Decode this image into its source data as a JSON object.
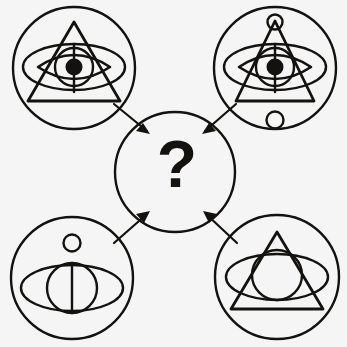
{
  "figure": {
    "type": "matrix-reasoning-puzzle",
    "background_color": "#f5f5f6",
    "ink_color": "#14120f",
    "canvas": {
      "width": 347,
      "height": 347
    }
  },
  "center": {
    "name": "answer-node",
    "label": "?",
    "shape": "circle",
    "cx": 175,
    "cy": 172,
    "r": 60,
    "stroke_width": 2.4
  },
  "arrows": {
    "description": "Four arrows point inward from each corner panel to the center answer circle",
    "count": 4,
    "stroke_width": 2.2,
    "items": [
      {
        "name": "arrow-top-left-to-center",
        "from": "panel-top-left",
        "to": "answer-node",
        "direction": "down-right"
      },
      {
        "name": "arrow-top-right-to-center",
        "from": "panel-top-right",
        "to": "answer-node",
        "direction": "down-left"
      },
      {
        "name": "arrow-bottom-left-to-center",
        "from": "panel-bottom-left",
        "to": "answer-node",
        "direction": "up-right"
      },
      {
        "name": "arrow-bottom-right-to-center",
        "from": "panel-bottom-right",
        "to": "answer-node",
        "direction": "up-left"
      }
    ]
  },
  "panels": [
    {
      "name": "panel-top-left",
      "position": "top-left",
      "cx": 74,
      "cy": 68,
      "r": 61,
      "stroke_width": 2.4,
      "elements": [
        "outer-circle",
        "triangle",
        "ellipse",
        "eye-lens",
        "iris",
        "pupil",
        "vertical-line"
      ],
      "has_triangle": true,
      "has_ellipse": true,
      "has_eye_lens": true,
      "has_iris": true,
      "has_pupil": true,
      "has_vertical_line": true,
      "has_apex_circle": false,
      "has_satellite_circle": false,
      "triangle": {
        "apex_x": 74,
        "apex_y": 22,
        "left_x": 28,
        "right_x": 120,
        "base_y": 101
      },
      "ellipse": {
        "cx": 74,
        "cy": 67,
        "rx": 51,
        "ry": 23
      },
      "eye_lens": {
        "cx": 74,
        "cy": 67,
        "half_width": 36,
        "half_height": 24
      },
      "iris": {
        "cx": 74,
        "cy": 67,
        "r": 19
      },
      "pupil": {
        "cx": 74,
        "cy": 67,
        "r": 8.5
      },
      "vertical_line": {
        "x": 74,
        "y1": 44,
        "y2": 92
      }
    },
    {
      "name": "panel-top-right",
      "position": "top-right",
      "cx": 275,
      "cy": 68,
      "r": 61,
      "stroke_width": 2.4,
      "elements": [
        "outer-circle",
        "apex-circle",
        "triangle",
        "ellipse",
        "eye-lens",
        "iris",
        "pupil",
        "vertical-line",
        "satellite-circle"
      ],
      "has_triangle": true,
      "has_ellipse": true,
      "has_eye_lens": true,
      "has_iris": true,
      "has_pupil": true,
      "has_vertical_line": true,
      "has_apex_circle": true,
      "has_satellite_circle": true,
      "triangle": {
        "apex_x": 275,
        "apex_y": 21,
        "left_x": 236,
        "right_x": 314,
        "base_y": 101
      },
      "apex_circle": {
        "cx": 275,
        "cy": 22,
        "r": 7.5
      },
      "ellipse": {
        "cx": 275,
        "cy": 67,
        "rx": 51,
        "ry": 23
      },
      "eye_lens": {
        "cx": 275,
        "cy": 67,
        "half_width": 36,
        "half_height": 24
      },
      "iris": {
        "cx": 275,
        "cy": 67,
        "r": 19
      },
      "pupil": {
        "cx": 275,
        "cy": 67,
        "r": 8.5
      },
      "vertical_line": {
        "x": 275,
        "y1": 44,
        "y2": 92
      },
      "satellite_circle": {
        "cx": 275,
        "cy": 120,
        "r": 8.5,
        "placement": "below-eye"
      }
    },
    {
      "name": "panel-bottom-left",
      "position": "bottom-left",
      "cx": 72,
      "cy": 278,
      "r": 61,
      "stroke_width": 2.4,
      "elements": [
        "outer-circle",
        "satellite-circle",
        "ellipse",
        "iris",
        "vertical-line"
      ],
      "has_triangle": false,
      "has_ellipse": true,
      "has_eye_lens": false,
      "has_iris": true,
      "has_pupil": false,
      "has_vertical_line": true,
      "has_apex_circle": false,
      "has_satellite_circle": true,
      "ellipse": {
        "cx": 72,
        "cy": 288,
        "rx": 51,
        "ry": 23
      },
      "iris": {
        "cx": 72,
        "cy": 288,
        "r": 25
      },
      "vertical_line": {
        "x": 72,
        "y1": 263,
        "y2": 313
      },
      "satellite_circle": {
        "cx": 72,
        "cy": 243,
        "r": 8.5,
        "placement": "above-eye"
      }
    },
    {
      "name": "panel-bottom-right",
      "position": "bottom-right",
      "cx": 277,
      "cy": 277,
      "r": 62,
      "stroke_width": 2.4,
      "elements": [
        "outer-circle",
        "triangle",
        "ellipse",
        "iris"
      ],
      "has_triangle": true,
      "has_ellipse": true,
      "has_eye_lens": false,
      "has_iris": true,
      "has_pupil": false,
      "has_vertical_line": false,
      "has_apex_circle": false,
      "has_satellite_circle": false,
      "triangle": {
        "apex_x": 277,
        "apex_y": 232,
        "left_x": 231,
        "right_x": 323,
        "base_y": 309
      },
      "ellipse": {
        "cx": 277,
        "cy": 277,
        "rx": 51,
        "ry": 23
      },
      "iris": {
        "cx": 277,
        "cy": 275,
        "r": 25
      }
    }
  ]
}
